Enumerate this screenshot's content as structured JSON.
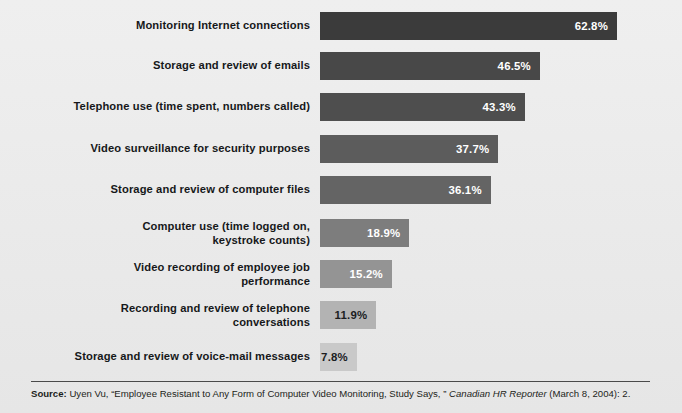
{
  "figure": {
    "background_color": "#ebebeb",
    "bar_start_x_px": 320,
    "axis_max_percent": 62.8
  },
  "chart_data": {
    "type": "bar",
    "orientation": "horizontal",
    "title": "",
    "subtitle": "",
    "xlabel": "",
    "ylabel": "",
    "xlim": [
      0,
      62.8
    ],
    "grid": false,
    "legend": "none",
    "value_suffix": "%",
    "categories": [
      "Monitoring Internet connections",
      "Storage and review of emails",
      "Telephone use (time spent, numbers called)",
      "Video surveillance for security purposes",
      "Storage and review of computer files",
      "Computer use (time logged on,\nkeystroke counts)",
      "Video recording of employee job\nperformance",
      "Recording and review of telephone\nconversations",
      "Storage and review of voice-mail messages"
    ],
    "values": [
      62.8,
      46.5,
      43.3,
      37.7,
      36.1,
      18.9,
      15.2,
      11.9,
      7.8
    ],
    "value_labels": [
      "62.8%",
      "46.5%",
      "43.3%",
      "37.7%",
      "36.1%",
      "18.9%",
      "15.2%",
      "11.9%",
      "7.8%"
    ],
    "bar_colors": [
      "#3b3b3b",
      "#484848",
      "#4e4e4e",
      "#5c5c5c",
      "#646464",
      "#7d7d7d",
      "#949494",
      "#b3b3b3",
      "#c9c9c9"
    ],
    "value_label_colors": [
      "#ffffff",
      "#ffffff",
      "#ffffff",
      "#ffffff",
      "#ffffff",
      "#ffffff",
      "#ffffff",
      "#1b1d1f",
      "#1b1d1f"
    ]
  },
  "footer": {
    "source_prefix": "Source:",
    "source_text_1": " Uyen Vu, “Employee Resistant to Any Form of Computer Video Monitoring, Study Says, ” ",
    "source_italic": "Canadian HR Reporter",
    "source_text_2": " (March 8, 2004): 2."
  }
}
